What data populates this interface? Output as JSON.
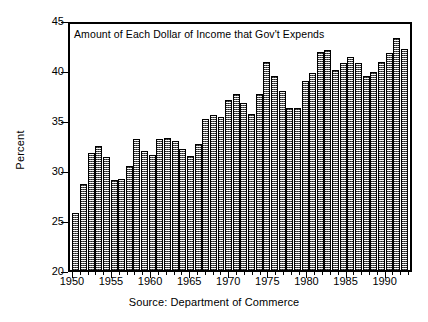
{
  "chart_data": {
    "type": "bar",
    "title": "Amount of Each Dollar of Income that Gov't Expends",
    "xlabel": "",
    "ylabel": "Percent",
    "caption": "Source: Department of Commerce",
    "ylim": [
      20,
      45
    ],
    "yticks": [
      20,
      25,
      30,
      35,
      40,
      45
    ],
    "ytick_labels": [
      "20",
      "25",
      "30",
      "35",
      "40",
      "45"
    ],
    "xticks": [
      1950,
      1955,
      1960,
      1965,
      1970,
      1975,
      1980,
      1985,
      1990
    ],
    "xtick_labels": [
      "1950",
      "1955",
      "1960",
      "1965",
      "1970",
      "1975",
      "1980",
      "1985",
      "1990"
    ],
    "xlim": [
      1949.5,
      1993.5
    ],
    "grid": false,
    "legend": null,
    "bar_fill": "#b4b4b4",
    "bar_edge": "#000000",
    "categories": [
      1950,
      1951,
      1952,
      1953,
      1954,
      1955,
      1956,
      1957,
      1958,
      1959,
      1960,
      1961,
      1962,
      1963,
      1964,
      1965,
      1966,
      1967,
      1968,
      1969,
      1970,
      1971,
      1972,
      1973,
      1974,
      1975,
      1976,
      1977,
      1978,
      1979,
      1980,
      1981,
      1982,
      1983,
      1984,
      1985,
      1986,
      1987,
      1988,
      1989,
      1990,
      1991,
      1992,
      1993
    ],
    "values": [
      25.8,
      28.7,
      31.9,
      32.6,
      31.5,
      29.1,
      29.2,
      30.6,
      33.3,
      32.1,
      31.7,
      33.3,
      33.4,
      33.1,
      32.3,
      31.6,
      32.8,
      35.3,
      35.8,
      35.5,
      37.3,
      37.9,
      37.0,
      35.9,
      37.9,
      41.1,
      39.7,
      38.2,
      36.5,
      36.5,
      39.2,
      40.0,
      42.2,
      42.4,
      40.3,
      41.0,
      41.6,
      41.0,
      39.7,
      40.1,
      41.1,
      42.1,
      43.6,
      42.5
    ]
  }
}
